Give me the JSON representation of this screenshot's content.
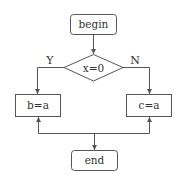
{
  "diagram": {
    "type": "flowchart",
    "nodes": {
      "begin": {
        "label": "begin",
        "shape": "rounded-rect"
      },
      "decision": {
        "label": "x=0",
        "shape": "diamond"
      },
      "left_process": {
        "label": "b=a",
        "shape": "rect"
      },
      "right_process": {
        "label": "c=a",
        "shape": "rect"
      },
      "end": {
        "label": "end",
        "shape": "rounded-rect"
      }
    },
    "edges": {
      "yes": {
        "from": "decision",
        "to": "left_process",
        "label": "Y"
      },
      "no": {
        "from": "decision",
        "to": "right_process",
        "label": "N"
      }
    },
    "colors": {
      "stroke": "#555555",
      "text": "#333333",
      "background": "#ffffff"
    }
  }
}
